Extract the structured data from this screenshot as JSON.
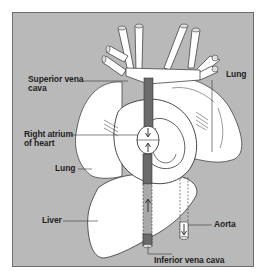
{
  "diagram": {
    "title": "",
    "colors": {
      "background": "#b9b9b9",
      "organ_fill": "#ffffff",
      "vessel_dark": "#6a6a6a",
      "outline": "#3c3c3c",
      "label_text": "#1f1f1f"
    },
    "labels": {
      "superior_vena_cava": [
        "Superior vena",
        "cava"
      ],
      "lung_right": "Lung",
      "right_atrium": [
        "Right atrium",
        "of heart"
      ],
      "lung_left": "Lung",
      "liver": "Liver",
      "aorta": "Aorta",
      "inferior_vena_cava": "Inferior vena cava"
    },
    "structures": [
      "superior vena cava",
      "lungs",
      "heart",
      "right atrium",
      "liver",
      "aorta",
      "inferior vena cava",
      "branching vessels"
    ],
    "flow_arrows": [
      "downward in superior vena cava",
      "upward in inferior vena cava",
      "downward in aorta"
    ]
  }
}
